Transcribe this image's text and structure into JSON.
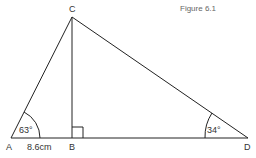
{
  "caption": "Figure 6.1",
  "points": {
    "A": "A",
    "B": "B",
    "C": "C",
    "D": "D"
  },
  "angles": {
    "A": "63°",
    "D": "34°"
  },
  "lengths": {
    "AB": "8.6cm"
  },
  "colors": {
    "line": "#222222",
    "text": "#333333"
  }
}
